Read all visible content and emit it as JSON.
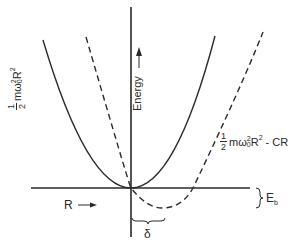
{
  "diagram": {
    "type": "potential-energy-curves",
    "axes": {
      "vertical_label": "Energy",
      "vertical_arrow": "↑",
      "horizontal_label": "R",
      "horizontal_arrow": "→"
    },
    "curves": [
      {
        "id": "harmonic",
        "style": "solid",
        "label_fraction_num": "1",
        "label_fraction_den": "2",
        "label_m": "m",
        "label_omega": "ω",
        "label_omega_sup": "2",
        "label_omega_sub": "0",
        "label_R": "R",
        "label_R_sup": "2",
        "label_suffix": ""
      },
      {
        "id": "shifted",
        "style": "dashed",
        "label_fraction_num": "1",
        "label_fraction_den": "2",
        "label_m": "m",
        "label_omega": "ω",
        "label_omega_sup": "2",
        "label_omega_sub": "0",
        "label_R": "R",
        "label_R_sup": "2",
        "label_suffix": " - CR"
      }
    ],
    "annotations": {
      "binding_energy": "E",
      "binding_energy_sub": "b",
      "displacement": "δ"
    },
    "colors": {
      "ink": "#2a2a2a",
      "background": "#ffffff"
    }
  }
}
